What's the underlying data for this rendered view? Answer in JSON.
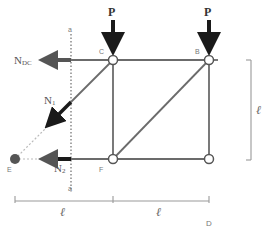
{
  "diagram": {
    "type": "truss-method-of-sections",
    "colors": {
      "member": "#6b6b6b",
      "force_arrow": "#1a1a1a",
      "section_arrow": "#555555",
      "section_line": "#777777",
      "dimension": "#999999",
      "dashed_extension": "#bbbbbb",
      "pivot_point": "#555555"
    },
    "nodes": [
      {
        "id": "C",
        "label": "C",
        "x": 113,
        "y": 60
      },
      {
        "id": "B",
        "label": "B",
        "x": 209,
        "y": 60
      },
      {
        "id": "F",
        "label": "F",
        "x": 113,
        "y": 159
      },
      {
        "id": "D",
        "label": "",
        "x": 209,
        "y": 159
      },
      {
        "id": "E",
        "label": "E",
        "x": 15,
        "y": 159
      }
    ],
    "loads": [
      {
        "label": "P",
        "at": "C"
      },
      {
        "label": "P",
        "at": "B"
      }
    ],
    "section": {
      "label_top": "a",
      "label_bottom": "a"
    },
    "internal_forces": [
      {
        "label_main": "N",
        "label_sub": "DC"
      },
      {
        "label_main": "N",
        "label_sub": "1"
      },
      {
        "label_main": "N",
        "label_sub": "2"
      }
    ],
    "dimensions": {
      "horizontal": [
        "ℓ",
        "ℓ"
      ],
      "vertical": "ℓ"
    },
    "cropped_label": "D"
  }
}
